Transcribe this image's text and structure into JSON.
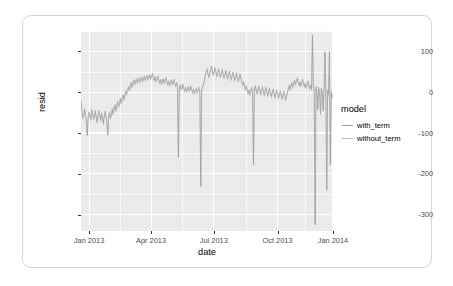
{
  "chart_data": {
    "type": "line",
    "title": "",
    "xlabel": "date",
    "ylabel": "resid",
    "xlim": [
      "2013-01-01",
      "2014-01-01"
    ],
    "ylim": [
      -340,
      150
    ],
    "grid": true,
    "legend_position": "right",
    "legend_title": "model",
    "x_ticks": [
      "Jan 2013",
      "Apr 2013",
      "Jul 2013",
      "Oct 2013",
      "Jan 2014"
    ],
    "y_ticks": [
      "100",
      "0",
      "-100",
      "-200",
      "-300"
    ],
    "y_tick_values": [
      100,
      0,
      -100,
      -200,
      -300
    ],
    "series": [
      {
        "name": "with_term",
        "color": "#9a9a9a",
        "values": [
          -18,
          -44,
          -62,
          -58,
          -40,
          -52,
          -70,
          -105,
          -62,
          -48,
          -55,
          -66,
          -42,
          -50,
          -64,
          -58,
          -45,
          -60,
          -72,
          -55,
          -44,
          -58,
          -68,
          -50,
          -62,
          -75,
          -58,
          -46,
          -60,
          -70,
          -103,
          -55,
          -48,
          -62,
          -54,
          -40,
          -52,
          -38,
          -30,
          -44,
          -36,
          -22,
          -34,
          -28,
          -14,
          -26,
          -18,
          -6,
          -16,
          -8,
          4,
          -4,
          6,
          14,
          6,
          16,
          24,
          14,
          22,
          30,
          20,
          28,
          34,
          24,
          30,
          36,
          26,
          32,
          38,
          28,
          34,
          40,
          30,
          36,
          42,
          32,
          38,
          44,
          34,
          40,
          46,
          36,
          30,
          38,
          28,
          34,
          40,
          30,
          24,
          32,
          22,
          28,
          34,
          24,
          30,
          36,
          26,
          20,
          28,
          18,
          24,
          30,
          20,
          26,
          32,
          22,
          16,
          24,
          14,
          -160,
          10,
          18,
          8,
          14,
          20,
          10,
          4,
          12,
          2,
          8,
          14,
          4,
          10,
          16,
          6,
          0,
          8,
          -2,
          4,
          10,
          0,
          6,
          12,
          2,
          -232,
          6,
          14,
          20,
          30,
          40,
          50,
          58,
          48,
          38,
          46,
          56,
          64,
          54,
          44,
          52,
          60,
          50,
          40,
          48,
          58,
          48,
          38,
          46,
          56,
          46,
          36,
          44,
          54,
          44,
          34,
          42,
          52,
          42,
          32,
          40,
          50,
          40,
          30,
          38,
          48,
          38,
          28,
          36,
          46,
          36,
          26,
          18,
          26,
          16,
          8,
          16,
          6,
          -2,
          6,
          -4,
          4,
          12,
          2,
          -178,
          8,
          16,
          6,
          -2,
          8,
          16,
          6,
          -4,
          6,
          14,
          4,
          -6,
          4,
          12,
          2,
          -8,
          2,
          10,
          0,
          -10,
          0,
          8,
          -2,
          -12,
          -2,
          6,
          -4,
          -14,
          -4,
          4,
          -6,
          -16,
          -6,
          2,
          -8,
          -18,
          -8,
          0,
          10,
          18,
          8,
          16,
          24,
          14,
          22,
          30,
          20,
          28,
          36,
          26,
          18,
          26,
          16,
          24,
          32,
          22,
          14,
          22,
          12,
          20,
          28,
          18,
          10,
          18,
          8,
          140,
          16,
          6,
          -325,
          14,
          4,
          -40,
          12,
          2,
          -52,
          10,
          0,
          -44,
          8,
          100,
          -2,
          -238,
          6,
          -4,
          100,
          -176,
          2,
          -8,
          -12
        ]
      },
      {
        "name": "without_term",
        "color": "#b9b9b9",
        "values": [
          -22,
          -48,
          -66,
          -62,
          -44,
          -56,
          -74,
          -108,
          -66,
          -52,
          -59,
          -70,
          -46,
          -54,
          -68,
          -62,
          -49,
          -64,
          -76,
          -59,
          -48,
          -62,
          -72,
          -54,
          -66,
          -79,
          -62,
          -50,
          -64,
          -74,
          -106,
          -59,
          -52,
          -66,
          -58,
          -44,
          -56,
          -42,
          -34,
          -48,
          -40,
          -26,
          -38,
          -32,
          -18,
          -30,
          -22,
          -10,
          -20,
          -12,
          0,
          -8,
          2,
          10,
          2,
          12,
          20,
          10,
          18,
          26,
          16,
          24,
          30,
          20,
          26,
          32,
          22,
          28,
          34,
          24,
          30,
          36,
          26,
          32,
          38,
          28,
          34,
          40,
          30,
          36,
          42,
          32,
          26,
          34,
          24,
          30,
          36,
          26,
          20,
          28,
          18,
          24,
          30,
          20,
          26,
          32,
          22,
          16,
          24,
          14,
          20,
          26,
          16,
          22,
          28,
          18,
          12,
          20,
          10,
          -156,
          6,
          14,
          4,
          10,
          16,
          6,
          0,
          8,
          -2,
          4,
          10,
          0,
          6,
          12,
          2,
          -4,
          4,
          -6,
          0,
          6,
          -4,
          2,
          8,
          -2,
          -228,
          2,
          10,
          16,
          26,
          36,
          46,
          54,
          44,
          34,
          42,
          52,
          60,
          50,
          40,
          48,
          56,
          46,
          36,
          44,
          54,
          44,
          34,
          42,
          52,
          42,
          32,
          40,
          50,
          40,
          30,
          38,
          48,
          38,
          28,
          36,
          46,
          36,
          26,
          34,
          44,
          34,
          24,
          32,
          42,
          32,
          22,
          14,
          22,
          12,
          4,
          12,
          2,
          -6,
          2,
          -8,
          0,
          8,
          -2,
          -174,
          4,
          12,
          2,
          -6,
          4,
          12,
          2,
          -8,
          2,
          10,
          0,
          -10,
          0,
          8,
          -2,
          -12,
          -2,
          6,
          -4,
          -14,
          -4,
          4,
          -6,
          -16,
          -6,
          2,
          -8,
          -18,
          -8,
          0,
          -10,
          -20,
          -10,
          -2,
          -12,
          -22,
          -12,
          -4,
          6,
          14,
          4,
          12,
          20,
          10,
          18,
          26,
          16,
          24,
          32,
          22,
          14,
          22,
          12,
          20,
          28,
          18,
          10,
          18,
          8,
          16,
          24,
          14,
          6,
          14,
          4,
          136,
          12,
          2,
          -321,
          10,
          0,
          -44,
          8,
          -2,
          -56,
          6,
          -4,
          -48,
          4,
          96,
          -6,
          -242,
          2,
          -8,
          96,
          -180,
          -2,
          -12,
          -16
        ]
      }
    ]
  }
}
